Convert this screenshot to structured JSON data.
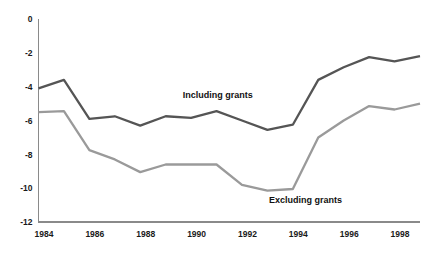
{
  "chart_data": {
    "type": "line",
    "title": "",
    "subtitle": "",
    "xlabel": "",
    "ylabel": "",
    "x": [
      1984,
      1985,
      1986,
      1987,
      1988,
      1989,
      1990,
      1991,
      1992,
      1993,
      1994,
      1995,
      1996,
      1997,
      1998,
      1999
    ],
    "xlim": [
      1984,
      1999
    ],
    "ylim": [
      -12,
      0
    ],
    "ytick_labels": [
      "0",
      "-2",
      "-4",
      "-6",
      "-8",
      "-10",
      "-12"
    ],
    "ytick_values": [
      0,
      -2,
      -4,
      -6,
      -8,
      -10,
      -12
    ],
    "xtick_labels": [
      "1984",
      "1986",
      "1988",
      "1990",
      "1992",
      "1994",
      "1996",
      "1998"
    ],
    "xtick_values": [
      1984,
      1986,
      1988,
      1990,
      1992,
      1994,
      1996,
      1998
    ],
    "grid": false,
    "legend_position": "inline-annotation",
    "series": [
      {
        "name": "Including grants",
        "color": "#555555",
        "label_x": 1991.05,
        "label_y": -4.65,
        "values": [
          -4.1,
          -3.6,
          -5.9,
          -5.75,
          -6.3,
          -5.75,
          -5.85,
          -5.45,
          -6.0,
          -6.55,
          -6.25,
          -3.6,
          -2.85,
          -2.25,
          -2.5,
          -2.2
        ]
      },
      {
        "name": "Excluding grants",
        "color": "#9a9a9a",
        "label_x": 1994.5,
        "label_y": -10.85,
        "values": [
          -5.5,
          -5.45,
          -7.75,
          -8.3,
          -9.05,
          -8.6,
          -8.6,
          -8.6,
          -9.8,
          -10.15,
          -10.05,
          -7.0,
          -6.0,
          -5.15,
          -5.35,
          -5.0
        ]
      }
    ]
  },
  "annotations": {
    "including_label": "Including grants",
    "excluding_label": "Excluding grants",
    "cropped_top_text": "........"
  },
  "colors": {
    "including_grants": "#555555",
    "excluding_grants": "#9a9a9a",
    "axis": "#8a8a8a",
    "text": "#1a1a1a",
    "background": "#ffffff"
  }
}
